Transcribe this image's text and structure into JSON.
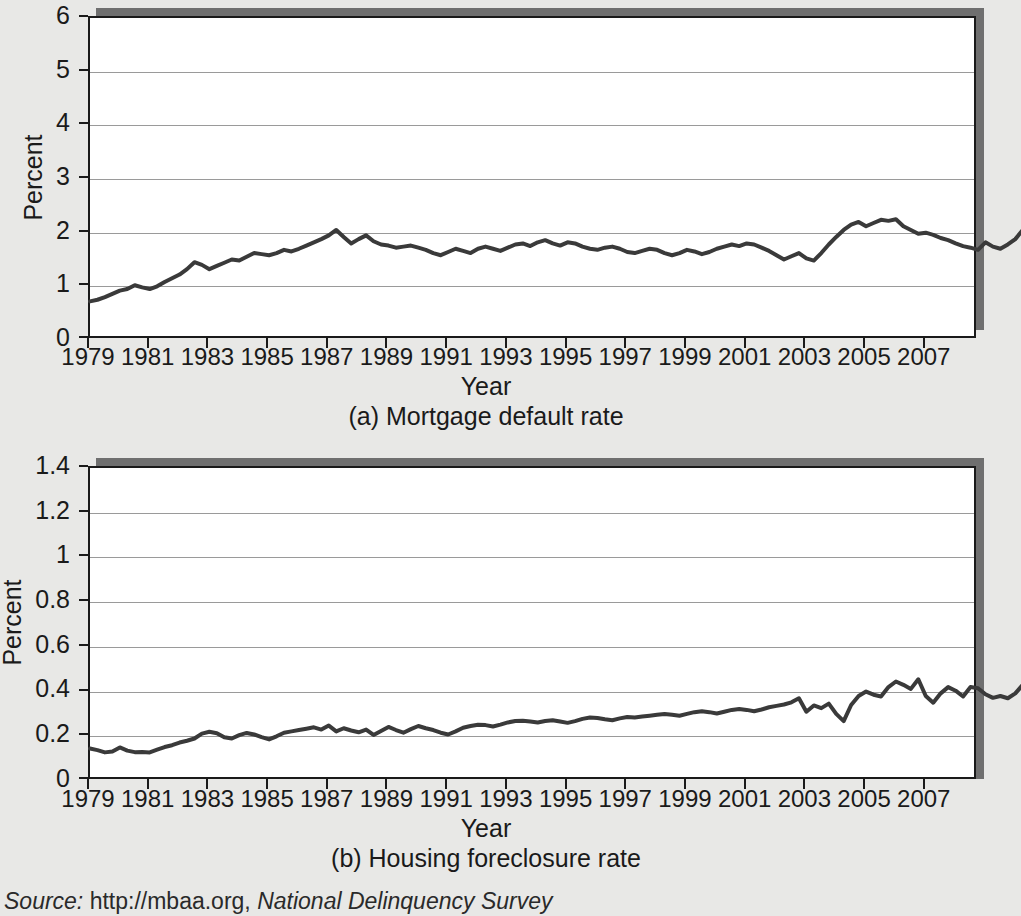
{
  "figure": {
    "source_label": "Source:",
    "source_body": " http://mbaa.org, ",
    "source_title": "National Delinquency Survey"
  },
  "panel_a": {
    "caption": "(a) Mortgage default rate",
    "xlabel": "Year",
    "ylabel": "Percent",
    "yticks": [
      "0",
      "1",
      "2",
      "3",
      "4",
      "5",
      "6"
    ],
    "xticks": [
      "1979",
      "1981",
      "1983",
      "1985",
      "1987",
      "1989",
      "1991",
      "1993",
      "1995",
      "1997",
      "1999",
      "2001",
      "2003",
      "2005",
      "2007"
    ]
  },
  "panel_b": {
    "caption": "(b) Housing foreclosure rate",
    "xlabel": "Year",
    "ylabel": "Percent",
    "yticks": [
      "0",
      "0.2",
      "0.4",
      "0.6",
      "0.8",
      "1",
      "1.2",
      "1.4"
    ],
    "xticks": [
      "1979",
      "1981",
      "1983",
      "1985",
      "1987",
      "1989",
      "1991",
      "1993",
      "1995",
      "1997",
      "1999",
      "2001",
      "2003",
      "2005",
      "2007"
    ]
  },
  "chart_data": [
    {
      "type": "line",
      "title": "(a) Mortgage default rate",
      "xlabel": "Year",
      "ylabel": "Percent",
      "xlim": [
        1979.0,
        2008.75
      ],
      "ylim": [
        0,
        6
      ],
      "yticks": [
        0,
        1,
        2,
        3,
        4,
        5,
        6
      ],
      "xticks": [
        1979,
        1981,
        1983,
        1985,
        1987,
        1989,
        1991,
        1993,
        1995,
        1997,
        1999,
        2001,
        2003,
        2005,
        2007
      ],
      "grid": true,
      "legend": "none",
      "line_color": "#3a3a3a",
      "x_start": 1979.0,
      "x_step": 0.25,
      "series": [
        {
          "name": "Mortgage default rate",
          "values": [
            0.72,
            0.75,
            0.8,
            0.86,
            0.92,
            0.95,
            1.02,
            0.98,
            0.95,
            1.0,
            1.08,
            1.15,
            1.22,
            1.32,
            1.45,
            1.4,
            1.32,
            1.38,
            1.44,
            1.5,
            1.48,
            1.55,
            1.62,
            1.6,
            1.58,
            1.62,
            1.68,
            1.65,
            1.7,
            1.76,
            1.82,
            1.88,
            1.95,
            2.05,
            1.92,
            1.8,
            1.88,
            1.95,
            1.84,
            1.78,
            1.76,
            1.72,
            1.74,
            1.76,
            1.72,
            1.68,
            1.62,
            1.58,
            1.64,
            1.7,
            1.66,
            1.62,
            1.7,
            1.74,
            1.7,
            1.66,
            1.72,
            1.78,
            1.8,
            1.75,
            1.82,
            1.86,
            1.8,
            1.76,
            1.82,
            1.8,
            1.74,
            1.7,
            1.68,
            1.72,
            1.74,
            1.7,
            1.64,
            1.62,
            1.66,
            1.7,
            1.68,
            1.62,
            1.58,
            1.62,
            1.68,
            1.65,
            1.6,
            1.64,
            1.7,
            1.74,
            1.78,
            1.75,
            1.8,
            1.78,
            1.72,
            1.66,
            1.58,
            1.5,
            1.56,
            1.62,
            1.52,
            1.48,
            1.62,
            1.78,
            1.92,
            2.05,
            2.15,
            2.2,
            2.12,
            2.18,
            2.24,
            2.22,
            2.25,
            2.12,
            2.05,
            1.98,
            2.0,
            1.96,
            1.9,
            1.86,
            1.8,
            1.75,
            1.72,
            1.68,
            1.82,
            1.74,
            1.7,
            1.78,
            1.88,
            2.05,
            2.4,
            2.95,
            3.45,
            4.05,
            4.55,
            4.92
          ]
        }
      ]
    },
    {
      "type": "line",
      "title": "(b) Housing foreclosure rate",
      "xlabel": "Year",
      "ylabel": "Percent",
      "xlim": [
        1979.0,
        2008.75
      ],
      "ylim": [
        0,
        1.4
      ],
      "yticks": [
        0,
        0.2,
        0.4,
        0.6,
        0.8,
        1.0,
        1.2,
        1.4
      ],
      "xticks": [
        1979,
        1981,
        1983,
        1985,
        1987,
        1989,
        1991,
        1993,
        1995,
        1997,
        1999,
        2001,
        2003,
        2005,
        2007
      ],
      "grid": true,
      "legend": "none",
      "line_color": "#3a3a3a",
      "x_start": 1979.0,
      "x_step": 0.25,
      "series": [
        {
          "name": "Housing foreclosure rate",
          "values": [
            0.145,
            0.138,
            0.128,
            0.132,
            0.15,
            0.136,
            0.129,
            0.13,
            0.128,
            0.14,
            0.152,
            0.16,
            0.172,
            0.18,
            0.19,
            0.212,
            0.22,
            0.214,
            0.196,
            0.19,
            0.205,
            0.215,
            0.208,
            0.196,
            0.186,
            0.2,
            0.216,
            0.222,
            0.228,
            0.234,
            0.24,
            0.23,
            0.248,
            0.222,
            0.236,
            0.226,
            0.218,
            0.23,
            0.206,
            0.224,
            0.242,
            0.228,
            0.216,
            0.232,
            0.246,
            0.236,
            0.228,
            0.216,
            0.208,
            0.222,
            0.238,
            0.246,
            0.252,
            0.25,
            0.244,
            0.252,
            0.262,
            0.268,
            0.27,
            0.266,
            0.262,
            0.268,
            0.272,
            0.266,
            0.26,
            0.268,
            0.278,
            0.284,
            0.282,
            0.276,
            0.272,
            0.28,
            0.286,
            0.284,
            0.288,
            0.292,
            0.296,
            0.3,
            0.296,
            0.292,
            0.3,
            0.308,
            0.312,
            0.308,
            0.302,
            0.31,
            0.318,
            0.322,
            0.318,
            0.312,
            0.32,
            0.33,
            0.336,
            0.342,
            0.352,
            0.37,
            0.31,
            0.338,
            0.326,
            0.346,
            0.3,
            0.268,
            0.34,
            0.38,
            0.4,
            0.386,
            0.378,
            0.42,
            0.445,
            0.43,
            0.412,
            0.455,
            0.38,
            0.35,
            0.392,
            0.42,
            0.404,
            0.378,
            0.42,
            0.415,
            0.388,
            0.372,
            0.38,
            0.37,
            0.392,
            0.43,
            0.52,
            0.64,
            0.79,
            0.96,
            1.145,
            1.06
          ]
        }
      ]
    }
  ]
}
